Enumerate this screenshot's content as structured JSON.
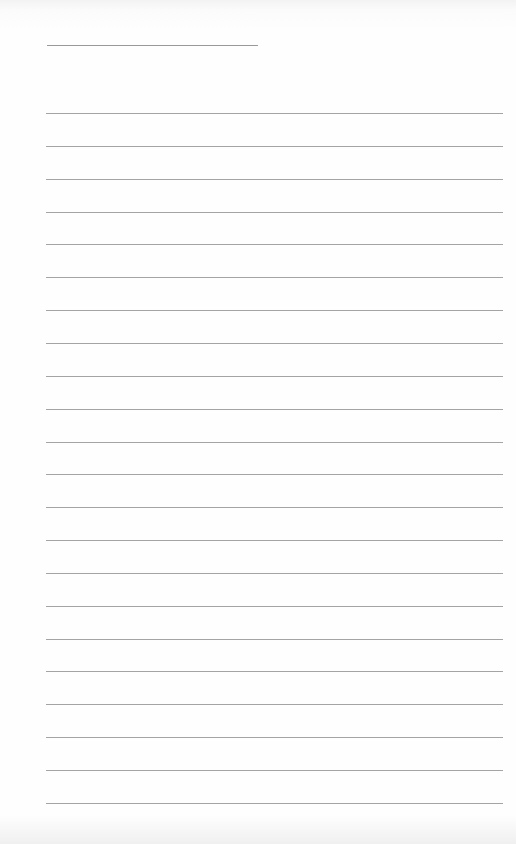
{
  "paper": {
    "type": "lined-notepad",
    "title_line": {
      "x": 47,
      "y": 45,
      "width": 211
    },
    "rules": {
      "count": 22,
      "start_y": 113,
      "spacing": 32.85,
      "x": 46,
      "width": 457
    },
    "line_color": "#a4a4a4",
    "background_color": "#fdfdfd"
  }
}
